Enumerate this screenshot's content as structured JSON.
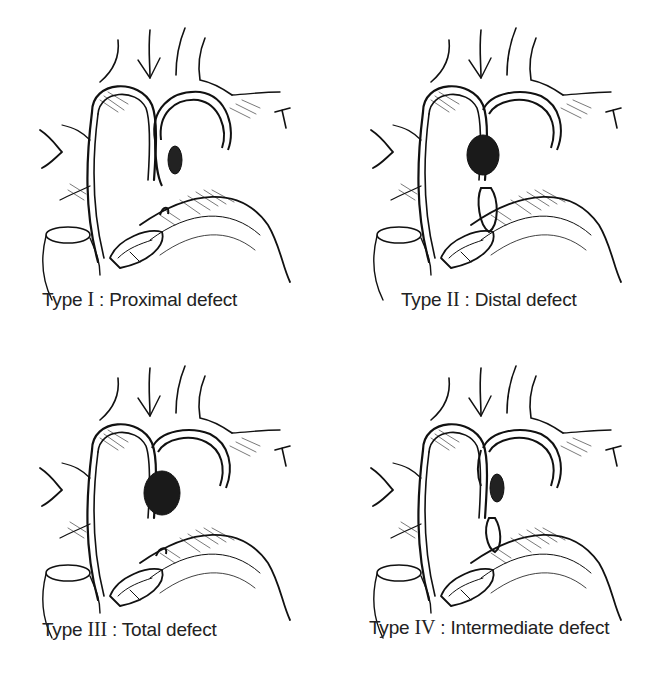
{
  "figure": {
    "panels": [
      {
        "id": "type-1",
        "type_word": "Type",
        "roman": "I",
        "sep": " : ",
        "desc": "Proximal defect",
        "defect": "proximal"
      },
      {
        "id": "type-2",
        "type_word": "Type",
        "roman": "II",
        "sep": " : ",
        "desc": "Distal defect",
        "defect": "distal"
      },
      {
        "id": "type-3",
        "type_word": "Type",
        "roman": "III",
        "sep": " : ",
        "desc": "Total defect",
        "defect": "total"
      },
      {
        "id": "type-4",
        "type_word": "Type",
        "roman": "IV",
        "sep": " : ",
        "desc": "Intermediate defect",
        "defect": "intermediate"
      }
    ],
    "colors": {
      "ink": "#111111",
      "background": "#ffffff",
      "text": "#222222"
    }
  }
}
